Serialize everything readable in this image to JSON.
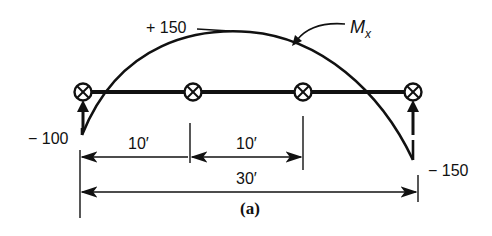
{
  "diagram": {
    "caption": "(a)",
    "moment_label": "M",
    "moment_subscript": "x",
    "peak_value": "+ 150",
    "left_value": "− 100",
    "right_value": "− 150",
    "dimensions": {
      "span1": "10′",
      "span2": "10′",
      "total": "30′"
    },
    "supports": [
      {
        "name": "support-a",
        "x": 83,
        "has_reaction_arrow": true
      },
      {
        "name": "support-b",
        "x": 193,
        "has_reaction_arrow": false
      },
      {
        "name": "support-c",
        "x": 303,
        "has_reaction_arrow": false
      },
      {
        "name": "support-d",
        "x": 413,
        "has_reaction_arrow": true
      }
    ],
    "colors": {
      "ink": "#111111",
      "background": "#ffffff"
    }
  }
}
